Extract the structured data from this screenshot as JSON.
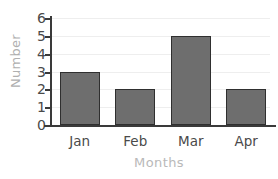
{
  "chart_data": {
    "type": "bar",
    "title": "",
    "categories": [
      "Jan",
      "Feb",
      "Mar",
      "Apr"
    ],
    "values": [
      3,
      2,
      5,
      2
    ],
    "xlabel": "Months",
    "ylabel": "Number",
    "ylim": [
      0,
      6
    ],
    "ytick_labels": [
      "0",
      "1",
      "2",
      "3",
      "4",
      "5",
      "6"
    ],
    "ytick_values": [
      0,
      1,
      2,
      3,
      4,
      5,
      6
    ],
    "grid": "horizontal",
    "legend": "none",
    "colors": {
      "bar_fill": "#6e6e6e",
      "bar_edge": "#2f2f2f",
      "gridline": "#eeeeee",
      "axis": "#3a3a3a",
      "tick_label": "#4a4a4a",
      "axis_title": "#b5b5b5",
      "background": "#ffffff"
    }
  }
}
